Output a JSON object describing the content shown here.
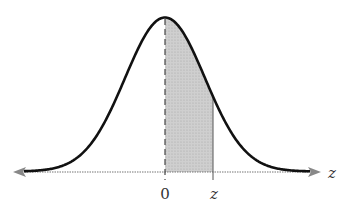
{
  "diagram": {
    "type": "standard-normal-curve",
    "shaded_region": "area between 0 and z",
    "labels": {
      "origin": "0",
      "z_mark": "z",
      "axis": "z"
    },
    "colors": {
      "curve": "#111111",
      "shade": "#c8c8c8",
      "axis": "#777777",
      "dashed_line": "#444444"
    }
  },
  "chart_data": {
    "type": "area",
    "title": "",
    "xlabel": "z",
    "ylabel": "",
    "tick_labels": [
      "0",
      "z"
    ],
    "curve": "standard normal density",
    "shaded_from": 0,
    "shaded_to": "z (approx 1.2)",
    "xlim": [
      -3.8,
      3.9
    ]
  }
}
